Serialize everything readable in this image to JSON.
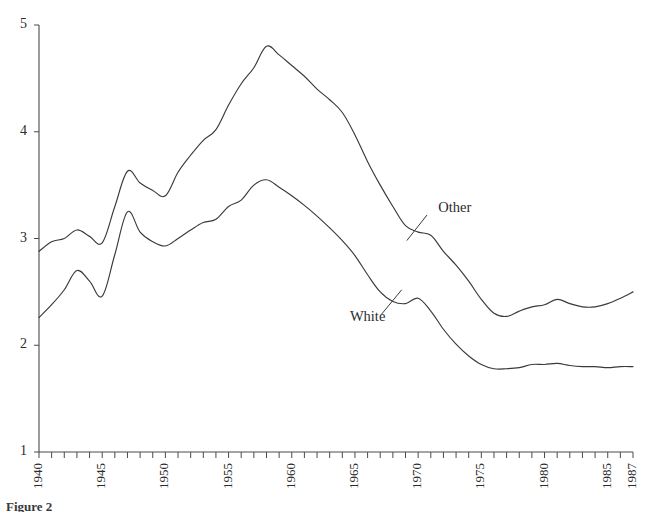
{
  "figure": {
    "caption": "Figure 2"
  },
  "labels": {
    "other": "Other",
    "white": "White"
  },
  "chart_data": {
    "type": "line",
    "title": "",
    "xlabel": "",
    "ylabel": "",
    "xlim": [
      1940,
      1987
    ],
    "ylim": [
      1,
      5
    ],
    "grid": false,
    "legend_position": "inline-annotation",
    "y_ticks": [
      1,
      2,
      3,
      4,
      5
    ],
    "x_ticks": [
      1940,
      1945,
      1950,
      1955,
      1960,
      1965,
      1970,
      1975,
      1980,
      1985,
      1987
    ],
    "x_minor_tick_interval": 1,
    "x": [
      1940,
      1941,
      1942,
      1943,
      1944,
      1945,
      1946,
      1947,
      1948,
      1949,
      1950,
      1951,
      1952,
      1953,
      1954,
      1955,
      1956,
      1957,
      1958,
      1959,
      1960,
      1961,
      1962,
      1963,
      1964,
      1965,
      1966,
      1967,
      1968,
      1969,
      1970,
      1971,
      1972,
      1973,
      1974,
      1975,
      1976,
      1977,
      1978,
      1979,
      1980,
      1981,
      1982,
      1983,
      1984,
      1985,
      1986,
      1987
    ],
    "series": [
      {
        "name": "Other",
        "values": [
          2.88,
          2.97,
          3.0,
          3.08,
          3.02,
          2.96,
          3.3,
          3.63,
          3.52,
          3.45,
          3.4,
          3.62,
          3.78,
          3.92,
          4.02,
          4.25,
          4.45,
          4.6,
          4.8,
          4.72,
          4.62,
          4.52,
          4.4,
          4.3,
          4.18,
          3.97,
          3.72,
          3.5,
          3.3,
          3.12,
          3.06,
          3.03,
          2.88,
          2.75,
          2.6,
          2.43,
          2.3,
          2.27,
          2.32,
          2.36,
          2.38,
          2.43,
          2.39,
          2.36,
          2.36,
          2.39,
          2.44,
          2.5
        ]
      },
      {
        "name": "White",
        "values": [
          2.26,
          2.38,
          2.52,
          2.7,
          2.6,
          2.46,
          2.85,
          3.25,
          3.06,
          2.97,
          2.93,
          3.0,
          3.08,
          3.15,
          3.18,
          3.3,
          3.36,
          3.5,
          3.55,
          3.48,
          3.4,
          3.31,
          3.21,
          3.1,
          2.98,
          2.84,
          2.66,
          2.5,
          2.41,
          2.39,
          2.44,
          2.32,
          2.15,
          2.01,
          1.9,
          1.82,
          1.78,
          1.78,
          1.79,
          1.82,
          1.82,
          1.83,
          1.81,
          1.8,
          1.8,
          1.79,
          1.8,
          1.8
        ]
      }
    ],
    "annotations": [
      {
        "text": "Other",
        "text_x": 1971.6,
        "text_y": 3.28,
        "leader_from_x": 1970.7,
        "leader_from_y": 3.22,
        "leader_to_x": 1969.1,
        "leader_to_y": 2.98
      },
      {
        "text": "White",
        "text_x": 1964.6,
        "text_y": 2.26,
        "leader_from_x": 1967.1,
        "leader_from_y": 2.29,
        "leader_to_x": 1968.7,
        "leader_to_y": 2.52
      }
    ]
  }
}
